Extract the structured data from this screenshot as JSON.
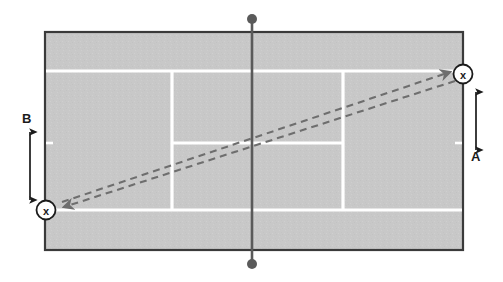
{
  "diagram": {
    "type": "tennis-court-shot-diagram",
    "title": "",
    "surface_color": "#c8c8c8",
    "line_color": "#ffffff",
    "border_color": "#3a3a3a",
    "net_color": "#5a5a5a",
    "shot_color": "#6e6e6e",
    "label_color": "#1b1b1b"
  },
  "labels": {
    "dimension_a": "A",
    "dimension_b": "B"
  },
  "markers": {
    "player_marker_glyph": "x",
    "start_marker": {
      "name": "player-position-near-left",
      "glyph": "x",
      "x": 46,
      "y": 210
    },
    "end_marker": {
      "name": "player-position-far-right",
      "glyph": "x",
      "x": 463,
      "y": 74
    }
  },
  "court": {
    "outer": {
      "x": 45,
      "y": 32,
      "width": 418,
      "height": 218
    },
    "singles_top_line_y": 71,
    "singles_bottom_line_y": 210,
    "service_box_left_x": 172,
    "service_box_right_x": 343,
    "center_service_line_y": 143,
    "net_x": 252,
    "net_top_y": 18,
    "net_bottom_y": 265,
    "net_post_radius": 5
  },
  "shot_paths": [
    {
      "name": "shot-path-outbound",
      "from_x": 60,
      "from_y": 203,
      "to_x": 452,
      "to_y": 72,
      "style": "dashed",
      "arrow": "end"
    },
    {
      "name": "shot-path-return",
      "from_x": 455,
      "from_y": 80,
      "to_x": 62,
      "to_y": 208,
      "style": "dashed",
      "arrow": "end"
    }
  ],
  "dimension_arrows": [
    {
      "name": "dimension-arrow-b",
      "orientation": "vertical",
      "x": 30,
      "top_y": 110,
      "bottom_y": 206,
      "heads": "both",
      "label": "B",
      "label_position": "above"
    },
    {
      "name": "dimension-arrow-a",
      "orientation": "vertical",
      "x": 476,
      "top_y": 82,
      "bottom_y": 148,
      "heads": "both",
      "label": "A",
      "label_position": "below"
    }
  ]
}
